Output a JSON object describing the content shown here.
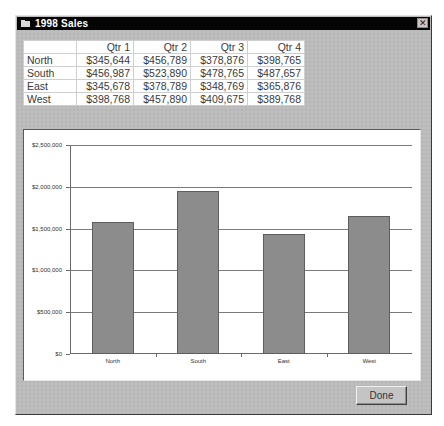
{
  "window": {
    "title": "1998 Sales",
    "close_glyph": "✕"
  },
  "table": {
    "columns": [
      "",
      "Qtr 1",
      "Qtr 2",
      "Qtr 3",
      "Qtr 4"
    ],
    "rows": [
      {
        "label": "North",
        "values": [
          "$345,644",
          "$456,789",
          "$378,876",
          "$398,765"
        ]
      },
      {
        "label": "South",
        "values": [
          "$456,987",
          "$523,890",
          "$478,765",
          "$487,657"
        ]
      },
      {
        "label": "East",
        "values": [
          "$345,678",
          "$378,789",
          "$348,769",
          "$365,876"
        ]
      },
      {
        "label": "West",
        "values": [
          "$398,768",
          "$457,890",
          "$409,675",
          "$389,768"
        ]
      }
    ]
  },
  "chart_data": {
    "type": "bar",
    "title": "",
    "xlabel": "",
    "ylabel": "",
    "categories": [
      "North",
      "South",
      "East",
      "West"
    ],
    "values": [
      1580074,
      1947299,
      1439112,
      1656101
    ],
    "ylim": [
      0,
      2500000
    ],
    "yticks": [
      0,
      500000,
      1000000,
      1500000,
      2000000,
      2500000
    ],
    "ytick_labels": [
      "$0",
      "$500,000",
      "$1,000,000",
      "$1,500,000",
      "$2,000,000",
      "$2,500,000"
    ],
    "grid": true,
    "legend": "none",
    "bar_color": "#8c8c8c"
  },
  "buttons": {
    "done_label": "Done"
  }
}
